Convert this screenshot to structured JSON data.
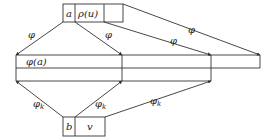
{
  "diagram": {
    "top_box": {
      "cells": [
        {
          "label": "a"
        },
        {
          "label": "ρ(u)"
        },
        {
          "label": ""
        }
      ]
    },
    "middle_band": {
      "cells": [
        {
          "label": "φ(a)"
        },
        {
          "label": ""
        },
        {
          "label": ""
        }
      ]
    },
    "bottom_box": {
      "cells": [
        {
          "label": "b"
        },
        {
          "label": "v"
        }
      ]
    },
    "edges_top": [
      {
        "label": "φ"
      },
      {
        "label": "φ"
      },
      {
        "label": "φ"
      },
      {
        "label": "φ"
      }
    ],
    "edges_bottom": [
      {
        "label": "φ",
        "sub": "k"
      },
      {
        "label": "φ",
        "sub": "k"
      },
      {
        "label": "φ",
        "sub": "k"
      }
    ]
  }
}
